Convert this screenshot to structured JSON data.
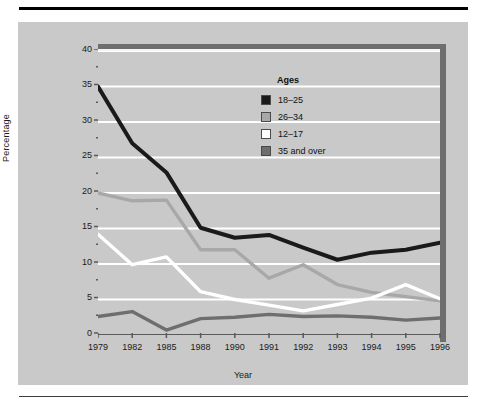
{
  "figure": {
    "background_color": "#c9c9c9",
    "plot_frame_color": "#6e6e6e",
    "gridline_color": "#ffffff"
  },
  "chart_data": {
    "type": "line",
    "title": "",
    "xlabel": "Year",
    "ylabel": "Percentage",
    "categories": [
      "1979",
      "1982",
      "1985",
      "1988",
      "1990",
      "1991",
      "1992",
      "1993",
      "1994",
      "1995",
      "1996"
    ],
    "ylim": [
      0,
      40
    ],
    "yticks": [
      0,
      5,
      10,
      15,
      20,
      25,
      30,
      35,
      40
    ],
    "ytick_labels": [
      "0",
      "5",
      "10",
      "15",
      "20",
      "25",
      "30",
      "35",
      "40"
    ],
    "minor_yticks": [
      2.5,
      7.5,
      12.5,
      17.5,
      22.5,
      27.5,
      32.5,
      37.5
    ],
    "grid": true,
    "legend_position": "upper right",
    "legend_title": "Ages",
    "series": [
      {
        "name": "18–25",
        "color": "#1a1a1a",
        "values": [
          35.0,
          27.0,
          22.9,
          15.1,
          13.7,
          14.1,
          12.3,
          10.6,
          11.6,
          12.0,
          13.0
        ]
      },
      {
        "name": "26–34",
        "color": "#a8a8a8",
        "values": [
          20.0,
          18.9,
          19.0,
          12.0,
          12.0,
          8.0,
          9.9,
          7.1,
          6.0,
          5.4,
          4.8
        ]
      },
      {
        "name": "12–17",
        "color": "#ffffff",
        "values": [
          14.2,
          9.9,
          11.0,
          6.1,
          5.0,
          4.2,
          3.4,
          4.3,
          5.2,
          7.1,
          5.1
        ]
      },
      {
        "name": "35 and over",
        "color": "#6e6e6e",
        "values": [
          2.6,
          3.3,
          0.7,
          2.3,
          2.5,
          2.9,
          2.6,
          2.7,
          2.5,
          2.1,
          2.4
        ]
      }
    ]
  },
  "legend": {
    "title": "Ages",
    "items": [
      {
        "label": "18–25",
        "color": "#1a1a1a"
      },
      {
        "label": "26–34",
        "color": "#a8a8a8"
      },
      {
        "label": "12–17",
        "color": "#ffffff"
      },
      {
        "label": "35 and over",
        "color": "#6e6e6e"
      }
    ]
  },
  "axes": {
    "y_title": "Percentage",
    "x_title": "Year"
  }
}
